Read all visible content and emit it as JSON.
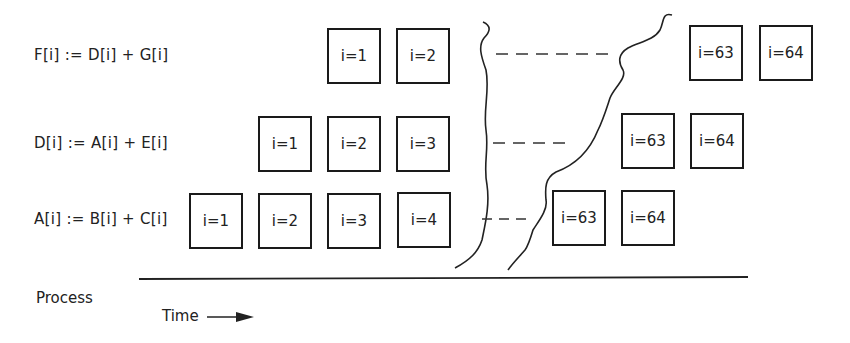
{
  "rows": [
    {
      "statement": "F[i] := D[i] + G[i]",
      "boxes_before_gap": [
        "i=1",
        "i=2"
      ],
      "boxes_after_gap": [
        "i=63",
        "i=64"
      ]
    },
    {
      "statement": "D[i] := A[i] + E[i]",
      "boxes_before_gap": [
        "i=1",
        "i=2",
        "i=3"
      ],
      "boxes_after_gap": [
        "i=63",
        "i=64"
      ]
    },
    {
      "statement": "A[i] := B[i] + C[i]",
      "boxes_before_gap": [
        "i=1",
        "i=2",
        "i=3",
        "i=4"
      ],
      "boxes_after_gap": [
        "i=63",
        "i=64"
      ]
    }
  ],
  "axis": {
    "y_label": "Process",
    "x_label": "Time"
  }
}
